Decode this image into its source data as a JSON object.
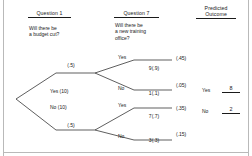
{
  "diagram": {
    "columns": {
      "question1_heading": "Question 1",
      "question2_heading": "Question 7",
      "outcome_heading_line1": "Predicted",
      "outcome_heading_line2": "Outcome"
    },
    "question1_text": "Will there be\na budget cut?",
    "question2_text": "Will there be\na new training\noffice?"
  },
  "tree": {
    "root_branches": [
      {
        "id": "yes-branch",
        "probability_label": "(.5)",
        "node_label": "Yes (10)"
      },
      {
        "id": "no-branch",
        "probability_label": "(.5)",
        "node_label": "No (10)"
      }
    ],
    "second_level": [
      {
        "id": "yes-yes",
        "answer": "Yes",
        "node_value": "9(.9)",
        "joint_probability": "(.45)"
      },
      {
        "id": "yes-no",
        "answer": "No",
        "node_value": "1(.1)",
        "joint_probability": "(.05)"
      },
      {
        "id": "no-yes",
        "answer": "Yes",
        "node_value": "7(.7)",
        "joint_probability": "(.35)"
      },
      {
        "id": "no-no",
        "answer": "No",
        "node_value": "3(.3)",
        "joint_probability": "(.15)"
      }
    ]
  },
  "predicted_outcome": {
    "rows": [
      {
        "label": "Yes",
        "value": "8"
      },
      {
        "label": "No",
        "value": "2"
      }
    ]
  },
  "colors": {
    "ink": "#1a1a1a",
    "page": "#ffffff",
    "rule": "#b9b9b9"
  }
}
